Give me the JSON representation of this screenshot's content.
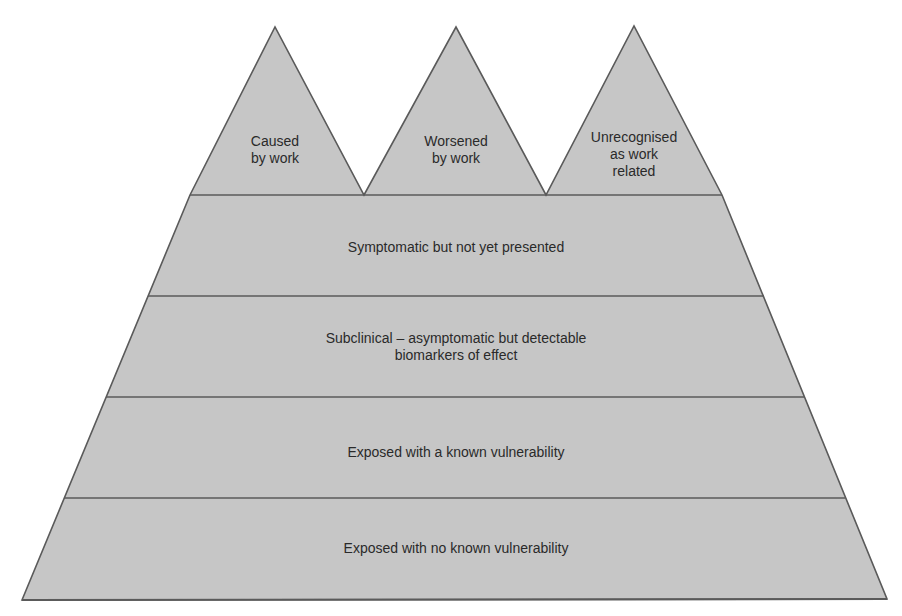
{
  "diagram": {
    "type": "iceberg-pyramid",
    "colors": {
      "fill": "#c6c6c6",
      "stroke": "#5a5a5a",
      "text": "#2a2a2a",
      "background": "#ffffff"
    },
    "peaks": [
      {
        "label": "Caused\nby work"
      },
      {
        "label": "Worsened\nby work"
      },
      {
        "label": "Unrecognised\nas work\nrelated"
      }
    ],
    "layers": [
      {
        "label": "Symptomatic but not yet presented"
      },
      {
        "label": "Subclinical – asymptomatic but detectable\nbiomarkers of effect"
      },
      {
        "label": "Exposed with a known vulnerability"
      },
      {
        "label": "Exposed with no known vulnerability"
      }
    ]
  }
}
